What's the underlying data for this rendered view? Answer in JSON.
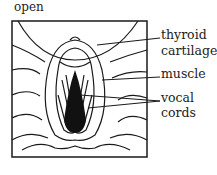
{
  "diagram": {
    "title": "open",
    "labels": {
      "thyroid_cartilage": [
        "thyroid",
        "cartilage"
      ],
      "muscle": "muscle",
      "vocal_cords": [
        "vocal",
        "cords"
      ]
    },
    "colors": {
      "ink": "#1a1a1a",
      "background": "#ffffff"
    }
  }
}
